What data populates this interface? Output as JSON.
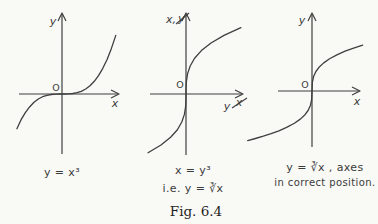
{
  "figure": {
    "label": "Fig. 6.4"
  },
  "colors": {
    "background": "#f9f9f6",
    "stroke": "#3f3f3f",
    "text": "#3b3b3b",
    "fig_text": "#1f1f1f"
  },
  "chart_data": [
    {
      "type": "line",
      "equation": "y = x³",
      "caption": "y = x³",
      "xlabel": "x",
      "ylabel": "y",
      "origin_label": "O",
      "grid": false,
      "axis_ticks": "none",
      "x": [
        -1.05,
        -0.95,
        -0.85,
        -0.75,
        -0.65,
        -0.55,
        -0.45,
        -0.35,
        -0.25,
        -0.15,
        -0.05,
        0,
        0.05,
        0.15,
        0.25,
        0.35,
        0.45,
        0.55,
        0.65,
        0.75,
        0.85,
        0.95,
        1.05,
        1.15,
        1.25
      ],
      "y": [
        -1.1576,
        -0.8574,
        -0.6141,
        -0.4219,
        -0.2746,
        -0.1664,
        -0.0911,
        -0.0429,
        -0.0156,
        -0.0034,
        -0.0001,
        0,
        0.0001,
        0.0034,
        0.0156,
        0.0429,
        0.0911,
        0.1664,
        0.2746,
        0.4219,
        0.6141,
        0.8574,
        1.1576,
        1.5209,
        1.9531
      ],
      "render": {
        "origin": [
          62,
          94
        ],
        "scale": [
          43,
          30
        ]
      }
    },
    {
      "type": "line",
      "equation": "x = y³",
      "caption_line1": "x = y³",
      "caption_line2": "i.e. y = ∛x",
      "xlabel_new": "y",
      "xlabel_old": "x",
      "ylabel_new": "x,",
      "ylabel_old": "y",
      "origin_label": "O",
      "grid": false,
      "axis_ticks": "none",
      "x": [
        -1.5209,
        -1.0,
        -0.6141,
        -0.343,
        -0.1664,
        -0.064,
        -0.0156,
        -0.001,
        0,
        0.001,
        0.0156,
        0.064,
        0.1664,
        0.343,
        0.6141,
        1.0,
        1.5209,
        2.197
      ],
      "y": [
        -1.15,
        -1.0,
        -0.85,
        -0.7,
        -0.55,
        -0.4,
        -0.25,
        -0.1,
        0,
        0.1,
        0.25,
        0.4,
        0.55,
        0.7,
        0.85,
        1.0,
        1.15,
        1.3
      ],
      "render": {
        "origin": [
          186,
          94
        ],
        "scale": [
          25,
          51
        ]
      }
    },
    {
      "type": "line",
      "equation": "y = ∛x",
      "caption_line1": "y = ∛x , axes",
      "caption_line2": "in correct position.",
      "xlabel": "x",
      "ylabel": "y",
      "origin_label": "O",
      "grid": false,
      "axis_ticks": "none",
      "x": [
        -1.65,
        -1.45,
        -1.25,
        -1.05,
        -0.85,
        -0.65,
        -0.45,
        -0.3,
        -0.18,
        -0.1,
        -0.04,
        -0.01,
        0,
        0.01,
        0.04,
        0.1,
        0.18,
        0.3,
        0.45,
        0.65,
        0.85,
        1.05,
        1.3
      ],
      "y": [
        -1.1817,
        -1.1316,
        -1.0772,
        -1.0164,
        -0.9473,
        -0.8662,
        -0.7663,
        -0.6694,
        -0.5646,
        -0.4642,
        -0.342,
        -0.2154,
        0,
        0.2154,
        0.342,
        0.4642,
        0.5646,
        0.6694,
        0.7663,
        0.8662,
        0.9473,
        1.0164,
        1.0914
      ],
      "render": {
        "origin": [
          312,
          91
        ],
        "scale": [
          39,
          42
        ]
      }
    }
  ]
}
